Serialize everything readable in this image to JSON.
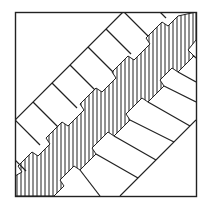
{
  "diagram": {
    "type": "line-art",
    "stroke_color": "#222222",
    "background": "#ffffff",
    "frame": {
      "x": 15,
      "y": 12,
      "width": 181,
      "height": 184
    },
    "upper_boundary": {
      "x1": 15,
      "y1": 120,
      "x2": 123,
      "y2": 12
    },
    "lower_boundary": {
      "x1": 120,
      "y1": 196,
      "x2": 196,
      "y2": 120
    },
    "hatch_spacing": 4
  }
}
